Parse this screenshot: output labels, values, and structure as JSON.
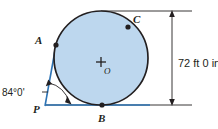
{
  "figure": {
    "colors": {
      "circle_fill": "#bdd7ee",
      "circle_stroke": "#231f20",
      "tangent_line": "#2e74b5",
      "dimension_line": "#231f20",
      "background": "#ffffff",
      "text": "#231f20"
    },
    "circle": {
      "center_x": 101,
      "center_y": 58,
      "radius": 47
    },
    "labels": {
      "point_a": "A",
      "point_b": "B",
      "point_c": "C",
      "point_p": "P",
      "center_o": "O"
    },
    "angle": {
      "value": "84°0'",
      "vertex": "P"
    },
    "dimension": {
      "value": "72 ft 0 in",
      "orientation": "vertical"
    }
  }
}
